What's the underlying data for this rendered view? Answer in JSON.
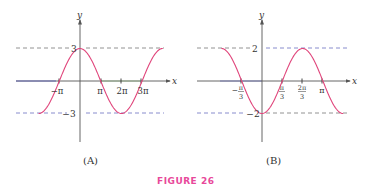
{
  "figure_caption": "FIGURE 26",
  "colors": {
    "curve": "#e0457b",
    "axis": "#555555",
    "dash_top": "#777777",
    "dash_bottom": "#6a6fc0",
    "caption": "#e8489a"
  },
  "chart_data": [
    {
      "type": "line",
      "panel_label": "(A)",
      "function": "y = 3cos(x/2)",
      "xlabel": "x",
      "ylabel": "y",
      "x_ticks": [
        "−π",
        "π",
        "2π",
        "3π"
      ],
      "x_tick_values": [
        -3.1416,
        3.1416,
        6.2832,
        9.4248
      ],
      "y_ticks": [
        "3",
        "−3"
      ],
      "y_tick_values": [
        3,
        -3
      ],
      "xlim": [
        -6.2832,
        12.566
      ],
      "ylim": [
        -3,
        3
      ],
      "dashed_lines": [
        3,
        -3
      ],
      "x": [
        -6.2832,
        -3.1416,
        0,
        3.1416,
        6.2832,
        9.4248,
        12.566
      ],
      "values": [
        -3,
        0,
        3,
        0,
        -3,
        0,
        3
      ],
      "grid": false
    },
    {
      "type": "line",
      "panel_label": "(B)",
      "function": "y = −2cos(3x/2)",
      "xlabel": "x",
      "ylabel": "y",
      "x_ticks": [
        "−π/3",
        "π/3",
        "2π/3",
        "π"
      ],
      "x_tick_values": [
        -1.0472,
        1.0472,
        2.0944,
        3.1416
      ],
      "y_ticks": [
        "2",
        "−2"
      ],
      "y_tick_values": [
        2,
        -2
      ],
      "xlim": [
        -2.0944,
        4.1888
      ],
      "ylim": [
        -2,
        2
      ],
      "dashed_lines": [
        2,
        -2
      ],
      "x": [
        -2.0944,
        -1.0472,
        0,
        1.0472,
        2.0944,
        3.1416,
        4.1888
      ],
      "values": [
        2,
        0,
        -2,
        0,
        2,
        0,
        -2
      ],
      "grid": false
    }
  ],
  "panels": {
    "a": {
      "label": "(A)",
      "xlabel": "x",
      "ylabel": "y",
      "tick_top": "3",
      "tick_bottom": "−3",
      "xt": [
        "−π",
        "π",
        "2π",
        "3π"
      ]
    },
    "b": {
      "label": "(B)",
      "xlabel": "x",
      "ylabel": "y",
      "tick_top": "2",
      "tick_bottom": "−2",
      "xt_num": [
        "π",
        "π",
        "2π",
        "π"
      ],
      "xt_den": [
        "3",
        "3",
        "3",
        ""
      ],
      "xt_neg": "−"
    }
  }
}
